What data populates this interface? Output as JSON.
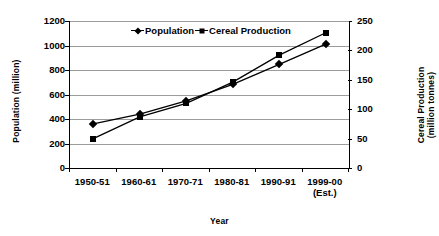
{
  "chart_data": {
    "type": "line",
    "title": "",
    "xlabel": "Year",
    "categories": [
      "1950-51",
      "1960-61",
      "1970-71",
      "1980-81",
      "1990-91",
      "1999-00"
    ],
    "category_sublabels": [
      "",
      "",
      "",
      "",
      "",
      "(Est.)"
    ],
    "grid": true,
    "legend_position": "top-center",
    "series": [
      {
        "name": "Population",
        "marker": "diamond",
        "axis": "left",
        "unit": "million",
        "values": [
          361,
          439,
          548,
          683,
          846,
          1012
        ]
      },
      {
        "name": "Cereal Production",
        "marker": "square",
        "axis": "right",
        "unit": "million tonnes",
        "values": [
          50,
          87,
          110,
          146,
          192,
          230
        ]
      }
    ],
    "left_axis": {
      "label": "Population (million)",
      "ticks": [
        0,
        200,
        400,
        600,
        800,
        1000,
        1200
      ],
      "ylim": [
        0,
        1200
      ]
    },
    "right_axis": {
      "label_line1": "Cereal Production",
      "label_line2": "(million tonnes)",
      "ticks": [
        0,
        50,
        100,
        150,
        200,
        250
      ],
      "ylim": [
        0,
        250
      ]
    },
    "colors": {
      "series": "#000000",
      "gridline": "#9c9c9c",
      "axis": "#000000",
      "background": "#ffffff"
    }
  }
}
